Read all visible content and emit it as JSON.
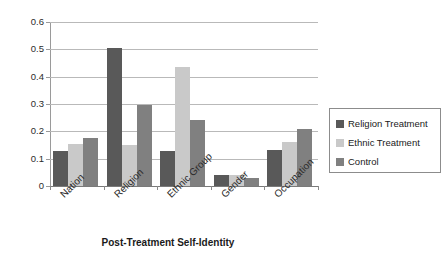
{
  "chart_data": {
    "type": "bar",
    "title": "",
    "subtitle": "",
    "xlabel": "Post-Treatment Self-Identity",
    "ylabel": "",
    "categories": [
      "Nation",
      "Religion",
      "Ethnic Group",
      "Gender",
      "Occupation"
    ],
    "series": [
      {
        "name": "Religion Treatment",
        "color": "#595959",
        "values": [
          0.128,
          0.505,
          0.128,
          0.041,
          0.133
        ]
      },
      {
        "name": "Ethnic Treatment",
        "color": "#c9c9c9",
        "values": [
          0.152,
          0.15,
          0.437,
          0.041,
          0.16
        ]
      },
      {
        "name": "Control",
        "color": "#808080",
        "values": [
          0.175,
          0.297,
          0.242,
          0.029,
          0.21
        ]
      }
    ],
    "ylim": [
      0,
      0.6
    ],
    "ytick_values": [
      0,
      0.1,
      0.2,
      0.3,
      0.4,
      0.5,
      0.6
    ],
    "ytick_labels": [
      "0",
      "0.1",
      "0.2",
      "0.3",
      "0.4",
      "0.5",
      "0.6"
    ],
    "grid": true,
    "grid_axis": "y",
    "legend_position": "right",
    "xtick_label_rotation": -45,
    "plot_background": "#ffffff",
    "gridline_color": "#b9b9b9",
    "axis_color": "#9a9a9a"
  },
  "legend": {
    "entries": [
      {
        "label": "Religion Treatment",
        "color": "#595959"
      },
      {
        "label": "Ethnic Treatment",
        "color": "#c9c9c9"
      },
      {
        "label": "Control",
        "color": "#808080"
      }
    ]
  }
}
